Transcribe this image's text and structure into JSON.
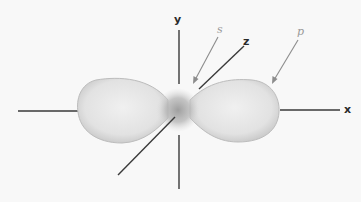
{
  "diagram": {
    "title": "",
    "labels": {
      "y_axis": "y",
      "z_axis": "z",
      "x_axis": "x",
      "s_orbital": "s",
      "p_orbital": "p"
    },
    "colors": {
      "axis": "#333333",
      "arrow": "#8c8c8c",
      "lobe_fill": "#e6e6e6",
      "lobe_edge": "#b5b5b5",
      "core": "#a8a8a8"
    }
  }
}
